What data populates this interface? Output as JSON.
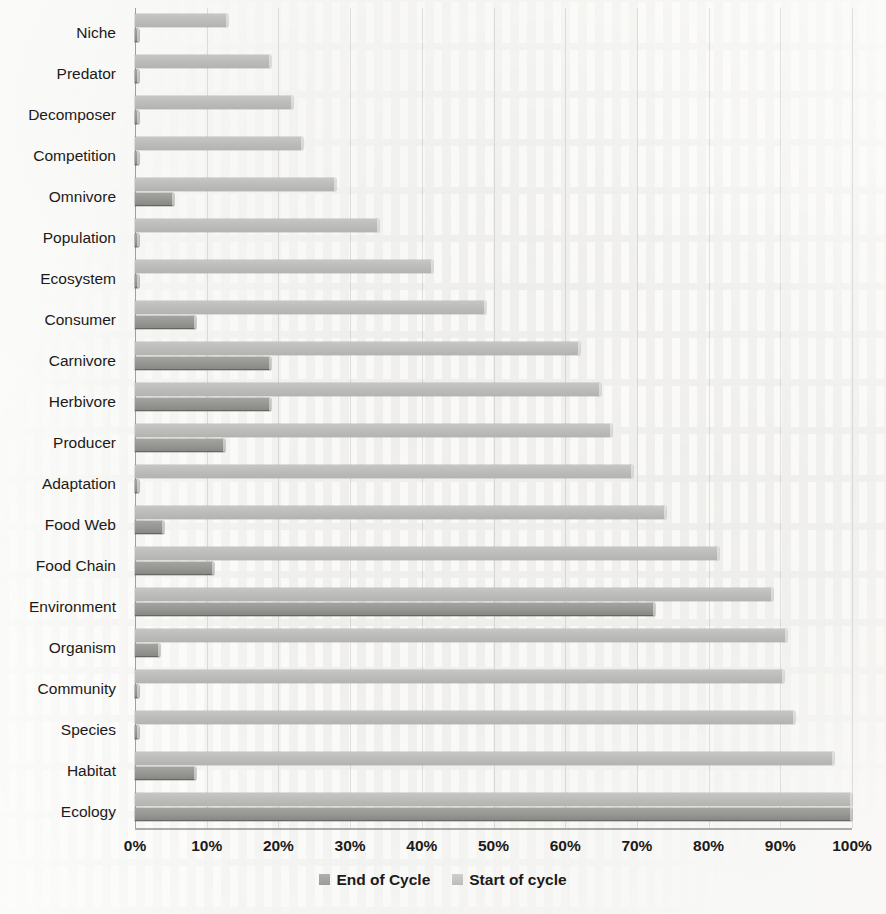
{
  "chart_data": {
    "type": "bar",
    "orientation": "horizontal",
    "title": "",
    "xlabel": "",
    "ylabel": "",
    "xlim": [
      0,
      100
    ],
    "xticks": [
      "0%",
      "10%",
      "20%",
      "30%",
      "40%",
      "50%",
      "60%",
      "70%",
      "80%",
      "90%",
      "100%"
    ],
    "xtick_values": [
      0,
      10,
      20,
      30,
      40,
      50,
      60,
      70,
      80,
      90,
      100
    ],
    "grid": true,
    "legend_position": "bottom",
    "categories": [
      "Niche",
      "Predator",
      "Decomposer",
      "Competition",
      "Omnivore",
      "Population",
      "Ecosystem",
      "Consumer",
      "Carnivore",
      "Herbivore",
      "Producer",
      "Adaptation",
      "Food Web",
      "Food Chain",
      "Environment",
      "Organism",
      "Community",
      "Species",
      "Habitat",
      "Ecology"
    ],
    "series": [
      {
        "name": "Start of cycle",
        "color": "#bdbdbb",
        "values": [
          13,
          19,
          22,
          23.5,
          28,
          34,
          41.5,
          49,
          62,
          65,
          66.5,
          69.5,
          74,
          81.5,
          89,
          91,
          90.5,
          92,
          97.5,
          100
        ]
      },
      {
        "name": "End of Cycle",
        "color": "#97979 4",
        "values": [
          0.5,
          0.5,
          0.5,
          0.5,
          5.5,
          0.5,
          0.5,
          8.5,
          19,
          19,
          12.5,
          0.5,
          4,
          11,
          72.5,
          3.5,
          0.5,
          0.5,
          8.5,
          100
        ]
      }
    ]
  },
  "legend": {
    "items": [
      {
        "label": "End of Cycle",
        "swatch": "legend-swatch-end-of-cycle"
      },
      {
        "label": "Start of cycle",
        "swatch": "legend-swatch-start-of-cycle"
      }
    ]
  },
  "colors": {
    "series_start": "#bdbdbb",
    "series_end": "#979794",
    "gridline": "#bdbdbb",
    "axis": "#6e6e6c",
    "text": "#1d1a18",
    "background": "#fcfbf9"
  }
}
